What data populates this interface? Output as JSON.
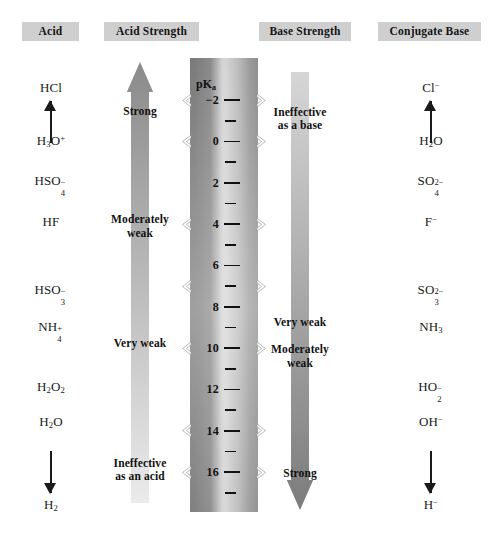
{
  "headers": [
    {
      "label": "Acid",
      "x": 22,
      "y": 22,
      "w": 57
    },
    {
      "label": "Acid Strength",
      "x": 104,
      "y": 22,
      "w": 95
    },
    {
      "label": "Base Strength",
      "x": 259,
      "y": 22,
      "w": 92
    },
    {
      "label": "Conjugate Base",
      "x": 378,
      "y": 22,
      "w": 103
    }
  ],
  "scale": {
    "axis_label": "pK",
    "axis_label_sub": "a",
    "major_ticks": [
      -2,
      0,
      2,
      4,
      6,
      8,
      10,
      12,
      14,
      16
    ],
    "minor_ticks": [
      -1,
      1,
      3,
      5,
      7,
      9,
      11,
      13,
      15,
      17
    ],
    "range": [
      -2.9,
      17.8
    ],
    "top_px": 100,
    "px_per_unit": 20.67
  },
  "acid_column": {
    "name": "Acid",
    "top_species": {
      "html": "HCl",
      "pka": -2.6
    },
    "bottom_species": {
      "html": "H<sub>2</sub>",
      "pka": 17.6
    },
    "species": [
      {
        "html": "H<sub>3</sub>O<sup>+</sup>",
        "pka": 0.0
      },
      {
        "html": "HSO<span class=\"stack\"><span class=\"chg\">&#8722;</span><span class=\"num\">4</span></span>&nbsp;&nbsp;",
        "plain": "HSO4-",
        "pka": 1.9
      },
      {
        "html": "HF",
        "pka": 3.9
      },
      {
        "html": "HSO<span class=\"stack\"><span class=\"chg\">&#8722;</span><span class=\"num\">3</span></span>&nbsp;&nbsp;",
        "plain": "HSO3-",
        "pka": 7.2
      },
      {
        "html": "NH<span class=\"stack\"><span class=\"chg\">+</span><span class=\"num\">4</span></span>&nbsp;&nbsp;",
        "plain": "NH4+",
        "pka": 9.0
      },
      {
        "html": "H<sub>2</sub>O<sub>2</sub>",
        "pka": 11.9
      },
      {
        "html": "H<sub>2</sub>O",
        "pka": 13.6
      }
    ],
    "arrow_direction": "up"
  },
  "conjugate_base_column": {
    "name": "Conjugate Base",
    "top_species": {
      "html": "Cl<sup>&#8722;</sup>",
      "pka": -2.6
    },
    "bottom_species": {
      "html": "H<sup>&#8722;</sup>",
      "pka": 17.6
    },
    "species": [
      {
        "html": "H<sub>2</sub>O",
        "pka": 0.0
      },
      {
        "html": "SO<span class=\"stack\"><span class=\"chg\">2&#8722;</span><span class=\"num\">4</span></span>&nbsp;&nbsp;&nbsp;",
        "plain": "SO4 2-",
        "pka": 1.9
      },
      {
        "html": "F<sup>&#8722;</sup>",
        "pka": 3.9
      },
      {
        "html": "SO<span class=\"stack\"><span class=\"chg\">2&#8722;</span><span class=\"num\">3</span></span>&nbsp;&nbsp;&nbsp;",
        "plain": "SO3 2-",
        "pka": 7.2
      },
      {
        "html": "NH<sub>3</sub>",
        "pka": 9.0
      },
      {
        "html": "HO<span class=\"stack\"><span class=\"chg\">&#8722;</span><span class=\"num\">2</span></span>&nbsp;&nbsp;",
        "plain": "HO2-",
        "pka": 11.9
      },
      {
        "html": "OH<sup>&#8722;</sup>",
        "pka": 13.6
      }
    ],
    "arrow_direction": "up"
  },
  "acid_strength_arrow": {
    "direction": "up",
    "top_color": "#8a8a8a",
    "bottom_color": "#ebebeb",
    "bands": [
      {
        "label": "Strong",
        "lines": [
          "Strong"
        ],
        "pka": -1.4
      },
      {
        "label": "Moderately weak",
        "lines": [
          "Moderately",
          "weak"
        ],
        "pka": 4.1
      },
      {
        "label": "Very weak",
        "lines": [
          "Very weak"
        ],
        "pka": 9.8
      },
      {
        "label": "Ineffective as an acid",
        "lines": [
          "Ineffective",
          "as an acid"
        ],
        "pka": 15.9
      }
    ]
  },
  "base_strength_arrow": {
    "direction": "down",
    "top_color": "#d6d6d6",
    "bottom_color": "#7c7c7c",
    "bands": [
      {
        "label": "Ineffective as a base",
        "lines": [
          "Ineffective",
          "as a base"
        ],
        "pka": -1.1
      },
      {
        "label": "Very weak",
        "lines": [
          "Very weak"
        ],
        "pka": 8.8
      },
      {
        "label": "Moderately weak",
        "lines": [
          "Moderately",
          "weak"
        ],
        "pka": 10.4
      },
      {
        "label": "Strong",
        "lines": [
          "Strong"
        ],
        "pka": 16.1
      }
    ]
  },
  "notches": {
    "pka_positions": [
      -2.0,
      0.0,
      4.0,
      7.0,
      10.0,
      14.0,
      16.0
    ],
    "sides": [
      "left",
      "right"
    ]
  },
  "colors": {
    "header_bg": "#cfcfcf",
    "text": "#1a1a1a",
    "scale_dark": "#7b7b7b",
    "scale_light": "#d6d6d6"
  }
}
